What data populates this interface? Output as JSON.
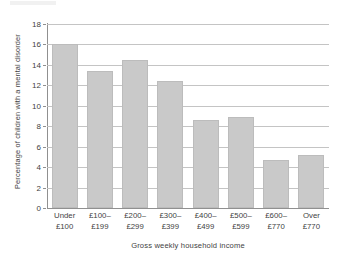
{
  "chart_data": {
    "type": "bar",
    "title": "",
    "xlabel": "Gross weekly household income",
    "ylabel": "Percentage of children with a mental disorder",
    "categories": [
      "Under £100",
      "£100–£199",
      "£200–£299",
      "£300–£399",
      "£400–£499",
      "£500–£599",
      "£600–£770",
      "Over £770"
    ],
    "category_lines": [
      [
        "Under",
        "£100"
      ],
      [
        "£100–",
        "£199"
      ],
      [
        "£200–",
        "£299"
      ],
      [
        "£300–",
        "£399"
      ],
      [
        "£400–",
        "£499"
      ],
      [
        "£500–",
        "£599"
      ],
      [
        "£600–",
        "£770"
      ],
      [
        "Over",
        "£770"
      ]
    ],
    "values": [
      16.0,
      13.4,
      14.5,
      12.4,
      8.6,
      8.9,
      4.7,
      5.2
    ],
    "ylim": [
      0,
      18
    ],
    "ytick_values": [
      0,
      2,
      4,
      6,
      8,
      10,
      12,
      14,
      16,
      18
    ],
    "ytick_labels": [
      "0",
      "2",
      "4",
      "6",
      "8",
      "10",
      "12",
      "14",
      "16",
      "18"
    ],
    "grid": "horizontal",
    "legend": "none",
    "bar_color": "#c9c9c9",
    "bar_border_color": "#bcbcbc",
    "gridline_color": "#c4c4c4",
    "axis_color": "#909090",
    "text_color": "#3f3f3f"
  }
}
